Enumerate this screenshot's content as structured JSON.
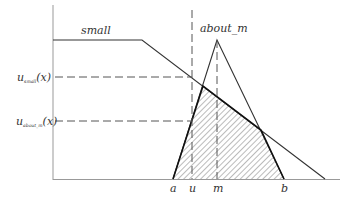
{
  "diagram": {
    "labels": {
      "small": "small",
      "about_m": "about_m",
      "u_small_base": "u",
      "u_small_sub": "small",
      "u_small_arg": "(x)",
      "u_about_base": "u",
      "u_about_sub": "about_m",
      "u_about_arg": "(x)",
      "a": "a",
      "u": "u",
      "m": "m",
      "b": "b"
    },
    "colors": {
      "line": "#222222",
      "axis": "#999999",
      "dash": "#555555",
      "hatch": "#444444"
    }
  }
}
